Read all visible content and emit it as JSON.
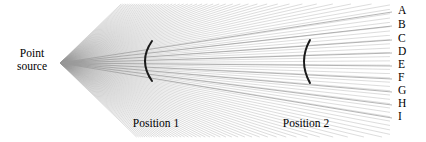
{
  "figure": {
    "background_color": "#ffffff",
    "width": 426,
    "height": 142,
    "source_label_line1": "Point",
    "source_label_line2": "source",
    "position_1_label": "Position 1",
    "position_2_label": "Position 2",
    "ray_endpoint_labels": [
      "A",
      "B",
      "C",
      "D",
      "E",
      "F",
      "G",
      "H",
      "I"
    ],
    "ray_color": "#9a9a9a",
    "arc_color": "#1a1a1a",
    "text_color": "#000000"
  },
  "chart_data": {
    "type": "line",
    "xlabel": "",
    "ylabel": "",
    "xlim": [
      0,
      426
    ],
    "ylim": [
      0,
      142
    ],
    "grid": false,
    "legend_position": "right",
    "source_point": {
      "x": 60,
      "y": 63
    },
    "fan": {
      "description": "Dense fan of straight rays emanating from the point source",
      "ray_count": 120,
      "angle_min_deg": -44,
      "angle_max_deg": 44,
      "color": "#9a9a9a",
      "line_width": 0.45,
      "opacity": 0.75
    },
    "labeled_rays": [
      {
        "label": "A",
        "x_end": 392,
        "y_end": 12
      },
      {
        "label": "B",
        "x_end": 392,
        "y_end": 26
      },
      {
        "label": "C",
        "x_end": 392,
        "y_end": 40
      },
      {
        "label": "D",
        "x_end": 392,
        "y_end": 53
      },
      {
        "label": "E",
        "x_end": 392,
        "y_end": 66
      },
      {
        "label": "F",
        "x_end": 392,
        "y_end": 79
      },
      {
        "label": "G",
        "x_end": 392,
        "y_end": 92
      },
      {
        "label": "H",
        "x_end": 392,
        "y_end": 105
      },
      {
        "label": "I",
        "x_end": 392,
        "y_end": 118
      }
    ],
    "wavefront_arcs": [
      {
        "name": "Position 1",
        "center_x": 152,
        "top_y": 41,
        "bottom_y": 81,
        "bulge": 7,
        "orientation": "concave-right",
        "color": "#1a1a1a",
        "line_width": 2.0
      },
      {
        "name": "Position 2",
        "center_x": 310,
        "top_y": 40,
        "bottom_y": 83,
        "bulge": 6,
        "orientation": "concave-right",
        "color": "#1a1a1a",
        "line_width": 2.0
      }
    ],
    "annotations": [
      {
        "text": "Point source",
        "x": 32,
        "y": 63
      },
      {
        "text": "Position 1",
        "x": 156,
        "y": 124
      },
      {
        "text": "Position 2",
        "x": 306,
        "y": 124
      }
    ]
  }
}
